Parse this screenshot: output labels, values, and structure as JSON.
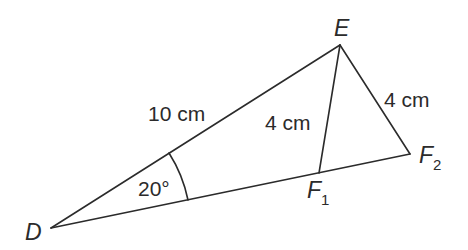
{
  "figure": {
    "colors": {
      "stroke": "#2b2b2b",
      "background": "#ffffff"
    },
    "vertices": {
      "D": {
        "label": "D",
        "x": 51,
        "y": 228
      },
      "E": {
        "label": "E",
        "x": 340,
        "y": 45
      },
      "F1": {
        "label": "F",
        "subscript": "1",
        "x": 319,
        "y": 173
      },
      "F2": {
        "label": "F",
        "subscript": "2",
        "x": 410,
        "y": 154
      }
    },
    "measurements": {
      "DE": "10 cm",
      "EF1": "4 cm",
      "EF2": "4 cm",
      "angle_D": "20°"
    }
  }
}
